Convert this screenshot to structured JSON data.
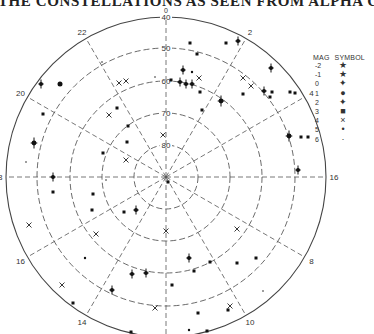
{
  "title": "THE CONSTELLATIONS AS SEEN FROM ALPHA CENTAURI",
  "chart": {
    "center": [
      166,
      177
    ],
    "dec_rings": [
      {
        "label": "40",
        "radius": 160,
        "solid": true
      },
      {
        "label": "50",
        "radius": 129,
        "solid": false
      },
      {
        "label": "60",
        "radius": 96,
        "solid": false
      },
      {
        "label": "70",
        "radius": 64,
        "solid": false
      },
      {
        "label": "80",
        "radius": 32,
        "solid": false
      }
    ],
    "top_label": "0",
    "hour_labels": [
      {
        "label": "2",
        "angle": 30
      },
      {
        "label": "4",
        "angle": 60
      },
      {
        "label": "16",
        "angle": 90
      },
      {
        "label": "8",
        "angle": 120
      },
      {
        "label": "10",
        "angle": 150
      },
      {
        "label": "14",
        "angle": 210
      },
      {
        "label": "16",
        "angle": 240
      },
      {
        "label": "18",
        "angle": 270
      },
      {
        "label": "20",
        "angle": 300
      },
      {
        "label": "22",
        "angle": 330
      }
    ]
  },
  "legend": {
    "header_mag": "MAG",
    "header_symbol": "SYMBOL",
    "rows": [
      {
        "mag": "-2",
        "symbol": "★"
      },
      {
        "mag": "-1",
        "symbol": "★"
      },
      {
        "mag": "0",
        "symbol": "✦"
      },
      {
        "mag": "1",
        "symbol": "●"
      },
      {
        "mag": "2",
        "symbol": "✦"
      },
      {
        "mag": "3",
        "symbol": "■"
      },
      {
        "mag": "4",
        "symbol": "×"
      },
      {
        "mag": "5",
        "symbol": "•"
      },
      {
        "mag": "6",
        "symbol": "·"
      }
    ]
  },
  "stars": [
    {
      "x": 41,
      "y": 84,
      "mag": 2
    },
    {
      "x": 60,
      "y": 84,
      "mag": 1
    },
    {
      "x": 43,
      "y": 114,
      "mag": 3
    },
    {
      "x": 34,
      "y": 143,
      "mag": 0
    },
    {
      "x": 26,
      "y": 162,
      "mag": 6
    },
    {
      "x": 53,
      "y": 177,
      "mag": 2
    },
    {
      "x": 53,
      "y": 192,
      "mag": 3
    },
    {
      "x": 29,
      "y": 225,
      "mag": 4
    },
    {
      "x": 102,
      "y": 62,
      "mag": 6
    },
    {
      "x": 119,
      "y": 83,
      "mag": 4
    },
    {
      "x": 126,
      "y": 81,
      "mag": 4
    },
    {
      "x": 117,
      "y": 108,
      "mag": 3
    },
    {
      "x": 109,
      "y": 115,
      "mag": 4
    },
    {
      "x": 128,
      "y": 126,
      "mag": 3
    },
    {
      "x": 127,
      "y": 142,
      "mag": 3
    },
    {
      "x": 103,
      "y": 153,
      "mag": 3
    },
    {
      "x": 126,
      "y": 160,
      "mag": 4
    },
    {
      "x": 106,
      "y": 180,
      "mag": 6
    },
    {
      "x": 93,
      "y": 194,
      "mag": 3
    },
    {
      "x": 92,
      "y": 210,
      "mag": 3
    },
    {
      "x": 124,
      "y": 212,
      "mag": 3
    },
    {
      "x": 136,
      "y": 210,
      "mag": 2
    },
    {
      "x": 96,
      "y": 234,
      "mag": 4
    },
    {
      "x": 85,
      "y": 258,
      "mag": 5
    },
    {
      "x": 62,
      "y": 285,
      "mag": 4
    },
    {
      "x": 73,
      "y": 303,
      "mag": 3
    },
    {
      "x": 132,
      "y": 274,
      "mag": 2
    },
    {
      "x": 146,
      "y": 273,
      "mag": 2
    },
    {
      "x": 112,
      "y": 290,
      "mag": 2
    },
    {
      "x": 155,
      "y": 308,
      "mag": 4
    },
    {
      "x": 131,
      "y": 332,
      "mag": 3
    },
    {
      "x": 155,
      "y": 77,
      "mag": 6
    },
    {
      "x": 171,
      "y": 80,
      "mag": 3
    },
    {
      "x": 183,
      "y": 70,
      "mag": 2
    },
    {
      "x": 186,
      "y": 84,
      "mag": 2
    },
    {
      "x": 192,
      "y": 72,
      "mag": 5
    },
    {
      "x": 192,
      "y": 84,
      "mag": 2
    },
    {
      "x": 197,
      "y": 54,
      "mag": 3
    },
    {
      "x": 190,
      "y": 43,
      "mag": 3
    },
    {
      "x": 238,
      "y": 41,
      "mag": 2
    },
    {
      "x": 226,
      "y": 43,
      "mag": 3
    },
    {
      "x": 199,
      "y": 78,
      "mag": 4
    },
    {
      "x": 180,
      "y": 82,
      "mag": 2
    },
    {
      "x": 200,
      "y": 92,
      "mag": 3
    },
    {
      "x": 202,
      "y": 110,
      "mag": 3
    },
    {
      "x": 221,
      "y": 101,
      "mag": 0
    },
    {
      "x": 243,
      "y": 78,
      "mag": 4
    },
    {
      "x": 251,
      "y": 86,
      "mag": 4
    },
    {
      "x": 264,
      "y": 91,
      "mag": 2
    },
    {
      "x": 243,
      "y": 94,
      "mag": 3
    },
    {
      "x": 270,
      "y": 97,
      "mag": 3
    },
    {
      "x": 271,
      "y": 68,
      "mag": 2
    },
    {
      "x": 295,
      "y": 93,
      "mag": 3
    },
    {
      "x": 272,
      "y": 92,
      "mag": 3
    },
    {
      "x": 290,
      "y": 92,
      "mag": 3
    },
    {
      "x": 289,
      "y": 136,
      "mag": 0
    },
    {
      "x": 301,
      "y": 137,
      "mag": 3
    },
    {
      "x": 308,
      "y": 137,
      "mag": 3
    },
    {
      "x": 298,
      "y": 170,
      "mag": 2
    },
    {
      "x": 168,
      "y": 182,
      "mag": 3
    },
    {
      "x": 237,
      "y": 229,
      "mag": 4
    },
    {
      "x": 189,
      "y": 258,
      "mag": 2
    },
    {
      "x": 210,
      "y": 262,
      "mag": 3
    },
    {
      "x": 194,
      "y": 271,
      "mag": 3
    },
    {
      "x": 237,
      "y": 263,
      "mag": 3
    },
    {
      "x": 256,
      "y": 258,
      "mag": 3
    },
    {
      "x": 172,
      "y": 285,
      "mag": 3
    },
    {
      "x": 263,
      "y": 291,
      "mag": 6
    },
    {
      "x": 230,
      "y": 306,
      "mag": 4
    },
    {
      "x": 228,
      "y": 310,
      "mag": 3
    },
    {
      "x": 198,
      "y": 313,
      "mag": 3
    },
    {
      "x": 189,
      "y": 330,
      "mag": 5
    },
    {
      "x": 207,
      "y": 331,
      "mag": 3
    },
    {
      "x": 166,
      "y": 231,
      "mag": 4
    },
    {
      "x": 163,
      "y": 135,
      "mag": 4
    }
  ]
}
